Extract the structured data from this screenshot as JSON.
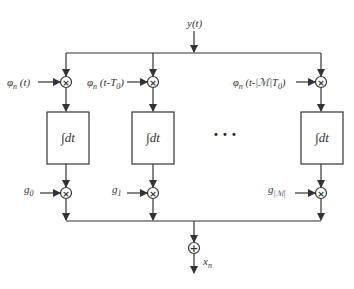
{
  "diagram": {
    "input": {
      "label": "y(t)"
    },
    "output": {
      "label": "x",
      "sub": "n"
    },
    "branches": [
      {
        "basis_label": "φ",
        "basis_sub": "n",
        "basis_arg": " (t)",
        "integrator": "∫dt",
        "gain": "g",
        "gain_sub": "0"
      },
      {
        "basis_label": "φ",
        "basis_sub": "n",
        "basis_arg": " (t-T",
        "basis_arg_sub": "0",
        "basis_arg_end": ")",
        "integrator": "∫dt",
        "gain": "g",
        "gain_sub": "1"
      },
      {
        "basis_label": "φ",
        "basis_sub": "n",
        "basis_arg": " (t-|ℳ|T",
        "basis_arg_sub": "0",
        "basis_arg_end": ")",
        "integrator": "∫dt",
        "gain": "g",
        "gain_sub": "|ℳ|"
      }
    ],
    "ellipsis": "• • •",
    "multiplier_symbol": "×",
    "sum_symbol": "+"
  }
}
